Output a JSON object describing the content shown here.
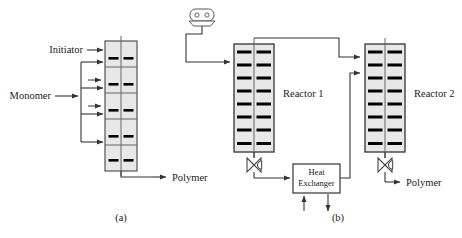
{
  "figure": {
    "caption_a": "(a)",
    "caption_b": "(b)",
    "background_color": "#ffffff",
    "line_color": "#333333",
    "tray_color": "#000000",
    "vessel_fill": "#e8e8e8",
    "text_color": "#1a1a1a"
  },
  "panel_a": {
    "name": "single-column-polymerization-reactor",
    "labels": {
      "initiator": "Initiator",
      "monomer": "Monomer",
      "polymer": "Polymer"
    },
    "column": {
      "segments": 5,
      "tray_rows": 5,
      "dashes_per_row": 2
    },
    "feed_arrows": {
      "initiator_count": 1,
      "monomer_branch_count": 4,
      "short_stub_count": 2
    }
  },
  "panel_b": {
    "name": "two-reactor-train-with-heat-exchanger",
    "labels": {
      "reactor_1": "Reactor 1",
      "reactor_2": "Reactor 2",
      "heat_exchanger_line1": "Heat",
      "heat_exchanger_line2": "Exchanger",
      "polymer": "Polymer"
    },
    "reactor_1": {
      "tray_rows": 8,
      "dashes_per_row": 2
    },
    "reactor_2": {
      "tray_rows": 8,
      "dashes_per_row": 2
    },
    "equipment": {
      "pump_icon": "pump-icon",
      "valve_1_icon": "control-valve-icon",
      "valve_2_icon": "control-valve-icon",
      "heat_exchanger_utility_in_arrows": 1,
      "heat_exchanger_utility_out_arrows": 1
    }
  }
}
